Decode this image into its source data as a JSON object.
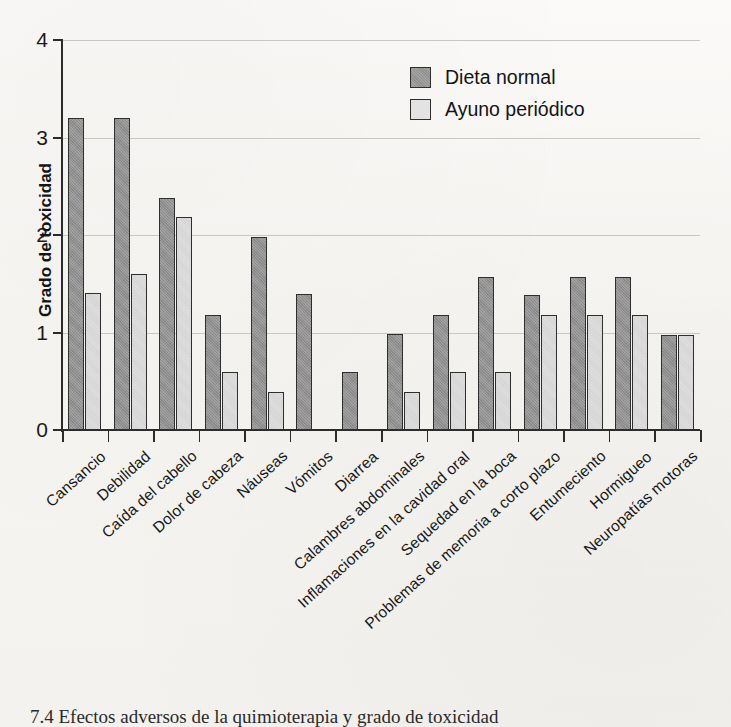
{
  "chart_data": {
    "type": "bar",
    "title": "",
    "xlabel": "",
    "ylabel": "Grado de toxicidad",
    "ylim": [
      0,
      4
    ],
    "yticks": [
      "0",
      "1",
      "2",
      "3",
      "4"
    ],
    "grid": true,
    "legend_position": "top-right",
    "categories": [
      "Cansancio",
      "Debilidad",
      "Caída del cabello",
      "Dolor de cabeza",
      "Náuseas",
      "Vómitos",
      "Diarrea",
      "Calambres abdominales",
      "Inflamaciones en la cavidad oral",
      "Sequedad en la boca",
      "Problemas de memoria a corto plazo",
      "Entumeciento",
      "Hormigueo",
      "Neuropatías motoras"
    ],
    "series": [
      {
        "name": "Dieta normal",
        "color": "#8f8f8f",
        "values": [
          3.2,
          3.2,
          2.38,
          1.18,
          1.98,
          1.39,
          0.59,
          0.98,
          1.18,
          1.57,
          1.38,
          1.57,
          1.57,
          0.97
        ]
      },
      {
        "name": "Ayuno periódico",
        "color": "#dedede",
        "values": [
          1.41,
          1.6,
          2.18,
          0.59,
          0.39,
          0,
          0,
          0.39,
          0.59,
          0.59,
          1.18,
          1.18,
          1.18,
          0.97
        ]
      }
    ]
  },
  "legend": {
    "items": [
      {
        "label": "Dieta normal",
        "swatch": "dark-gray-swatch"
      },
      {
        "label": "Ayuno periódico",
        "swatch": "light-gray-swatch"
      }
    ]
  },
  "axis": {
    "y_title": "Grado de toxicidad",
    "y_tick_labels": [
      "4",
      "3",
      "2",
      "1",
      "0"
    ]
  },
  "caption": {
    "text": "7.4  Efectos adversos de la quimioterapia y grado de toxicidad"
  }
}
